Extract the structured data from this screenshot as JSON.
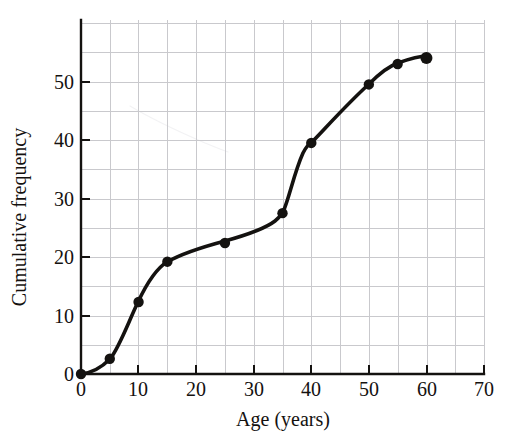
{
  "chart_data": {
    "type": "line",
    "title": "",
    "xlabel": "Age (years)",
    "ylabel": "Cumulative frequency",
    "xlim": [
      0,
      70
    ],
    "ylim": [
      0,
      58
    ],
    "xticks": [
      0,
      10,
      20,
      30,
      40,
      50,
      60,
      70
    ],
    "xtick_labels": [
      "0",
      "10",
      "20",
      "30",
      "40",
      "50",
      "60",
      "70"
    ],
    "yticks": [
      0,
      10,
      20,
      30,
      40,
      50
    ],
    "ytick_labels": [
      "0",
      "10",
      "20",
      "30",
      "40",
      "50"
    ],
    "grid": true,
    "grid_x_step": 5,
    "grid_y_step": 5,
    "legend": "none",
    "marker": "filled-circle",
    "line_color": "#141210",
    "grid_color": "#c9c9cd",
    "axis_color": "#141210",
    "x": [
      0,
      5,
      10,
      15,
      25,
      35,
      40,
      50,
      55,
      60
    ],
    "y": [
      0,
      2.6,
      12.3,
      19.2,
      22.4,
      27.5,
      39.5,
      49.5,
      53.0,
      54.0
    ],
    "points": [
      {
        "x": 0,
        "y": 0
      },
      {
        "x": 5,
        "y": 2.6
      },
      {
        "x": 10,
        "y": 12.3
      },
      {
        "x": 15,
        "y": 19.2
      },
      {
        "x": 25,
        "y": 22.4
      },
      {
        "x": 35,
        "y": 27.5
      },
      {
        "x": 40,
        "y": 39.5
      },
      {
        "x": 50,
        "y": 49.5
      },
      {
        "x": 55,
        "y": 53.0
      },
      {
        "x": 60,
        "y": 54.0
      }
    ]
  },
  "axes": {
    "x_title": "Age (years)",
    "y_title": "Cumulative frequency",
    "x_labels": [
      "0",
      "10",
      "20",
      "30",
      "40",
      "50",
      "60",
      "70"
    ],
    "y_labels": [
      "0",
      "10",
      "20",
      "30",
      "40",
      "50"
    ]
  }
}
